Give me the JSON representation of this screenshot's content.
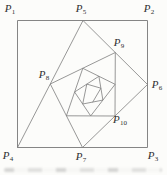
{
  "figure": {
    "colors": {
      "background": "#fcfcfa",
      "square_line": "#858585",
      "spiral_line": "#7d7d7d",
      "label": "#2f2f2f"
    },
    "points": {
      "P1": [
        17.5,
        20.5
      ],
      "P2": [
        147.5,
        20.5
      ],
      "P3": [
        147.5,
        147.5
      ],
      "P4": [
        17.5,
        147.5
      ],
      "P5": [
        83.0,
        20.5
      ],
      "P6": [
        147.5,
        84.5
      ],
      "P7": [
        82.5,
        147.5
      ],
      "P8": [
        50.3,
        84.0
      ],
      "P9": [
        115.3,
        52.5
      ],
      "P10": [
        115.0,
        116.0
      ],
      "P11": [
        66.4,
        115.8
      ],
      "P12": [
        82.8,
        68.3
      ],
      "P13": [
        115.1,
        84.3
      ],
      "P14": [
        90.7,
        115.9
      ],
      "P15": [
        74.6,
        92.0
      ],
      "P16": [
        98.9,
        76.3
      ],
      "P17": [
        102.9,
        100.1
      ],
      "P18": [
        82.7,
        104.0
      ],
      "P19": [
        86.8,
        84.1
      ],
      "P20": [
        100.9,
        88.2
      ],
      "P21": [
        92.8,
        102.0
      ]
    },
    "square": [
      "P1",
      "P2",
      "P3",
      "P4"
    ],
    "spiral": [
      "P4",
      "P5",
      "P6",
      "P7",
      "P8",
      "P9",
      "P10",
      "P11",
      "P12",
      "P13",
      "P14",
      "P15",
      "P16",
      "P17",
      "P18",
      "P19",
      "P20",
      "P21"
    ],
    "labels": [
      {
        "letter": "P",
        "sub": "1",
        "x": 10,
        "y": 8
      },
      {
        "letter": "P",
        "sub": "2",
        "x": 149,
        "y": 8
      },
      {
        "letter": "P",
        "sub": "3",
        "x": 153,
        "y": 155
      },
      {
        "letter": "P",
        "sub": "4",
        "x": 8,
        "y": 155
      },
      {
        "letter": "P",
        "sub": "5",
        "x": 81,
        "y": 8
      },
      {
        "letter": "P",
        "sub": "6",
        "x": 157,
        "y": 84
      },
      {
        "letter": "P",
        "sub": "7",
        "x": 81,
        "y": 156
      },
      {
        "letter": "P",
        "sub": "8",
        "x": 44,
        "y": 74
      },
      {
        "letter": "P",
        "sub": "9",
        "x": 119,
        "y": 42
      },
      {
        "letter": "P",
        "sub": "10",
        "x": 120,
        "y": 119
      }
    ]
  }
}
